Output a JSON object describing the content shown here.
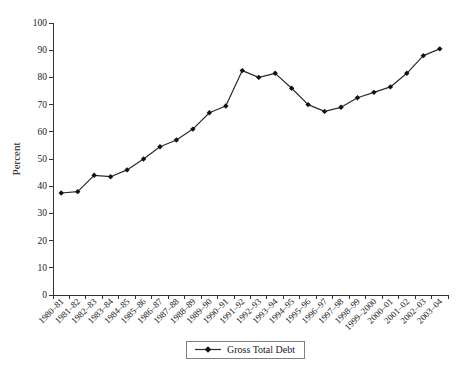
{
  "chart_data": {
    "type": "line",
    "title": "",
    "xlabel": "",
    "ylabel": "Percent",
    "ylim": [
      0,
      100
    ],
    "ytick_step": 10,
    "grid": false,
    "legend_position": "bottom-center",
    "categories": [
      "1980–81",
      "1981–82",
      "1982–83",
      "1983–84",
      "1984–85",
      "1985–86",
      "1986–87",
      "1987–88",
      "1988–89",
      "1989–90",
      "1990–91",
      "1991–92",
      "1992–93",
      "1993–94",
      "1994–95",
      "1995–96",
      "1996–97",
      "1997–98",
      "1998–99",
      "1999–2000",
      "2000–01",
      "2001–02",
      "2002–03",
      "2003–04"
    ],
    "series": [
      {
        "name": "Gross Total Debt",
        "values": [
          37.5,
          38,
          44,
          43.5,
          46,
          50,
          54.5,
          57,
          61,
          67,
          69.5,
          82.5,
          80,
          81.5,
          76,
          70,
          67.5,
          69,
          72.5,
          74.5,
          76.5,
          81.5,
          88,
          90.5
        ]
      }
    ],
    "marker": "diamond",
    "colors": {
      "line": "#2b2b2b",
      "marker": "#111111",
      "axis": "#333333",
      "text": "#1a1a1a",
      "legend_border": "#808080",
      "background": "#ffffff"
    }
  }
}
